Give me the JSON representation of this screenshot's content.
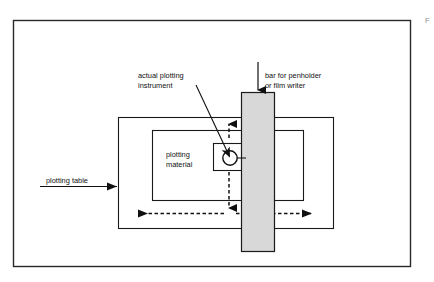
{
  "figure": {
    "corner_mark": "F",
    "background_color": "#ffffff",
    "line_color": "#101010",
    "bar_fill_color": "#d8d8d8"
  },
  "labels": {
    "actual_plotting_instrument": {
      "line1": "actual plotting",
      "line2": "instrument"
    },
    "bar_for_penholder": {
      "line1": "bar for penholder",
      "line2": "or film writer"
    },
    "plotting_material": {
      "line1": "plotting",
      "line2": "material"
    },
    "plotting_table": {
      "line1": "plotting table"
    }
  },
  "parts": {
    "outer_frame": "figure-border",
    "plotting_table_rect": "plotting-table-outline",
    "plotting_material_rect": "plotting-material-outline",
    "right_guide_rect": "right-guide-outline",
    "carriage_box": "pen-carriage-box",
    "bar": "penholder-bar",
    "pen_circle": "plotting-instrument-circle"
  },
  "arrows": {
    "bar_pointer": {
      "name": "bar-leader-arrow",
      "style": "solid",
      "direction": "down"
    },
    "plotting_table_pointer": {
      "name": "plotting-table-leader-arrow",
      "style": "solid",
      "direction": "right"
    },
    "instrument_leader": {
      "name": "instrument-leader-arrow",
      "style": "solid",
      "direction": "down-left"
    },
    "vertical_motion": {
      "name": "vertical-motion-arrow",
      "style": "dashed",
      "direction": "up-down"
    },
    "horizontal_motion": {
      "name": "horizontal-motion-arrow",
      "style": "dashed",
      "direction": "left-right"
    }
  }
}
